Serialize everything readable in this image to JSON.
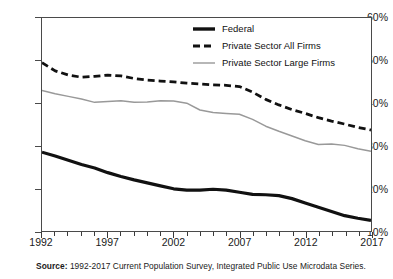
{
  "chart_data": {
    "type": "line",
    "title": "",
    "xlabel": "",
    "ylabel": "",
    "xlim": [
      1992,
      2017
    ],
    "ylim": [
      10,
      60
    ],
    "y_tick_labels": [
      "60%",
      "50%",
      "40%",
      "30%",
      "20%",
      "10%"
    ],
    "y_tick_values": [
      60,
      50,
      40,
      30,
      20,
      10
    ],
    "x_tick_labels": [
      "1992",
      "1997",
      "2002",
      "2007",
      "2012",
      "2017"
    ],
    "x_tick_values": [
      1992,
      1997,
      2002,
      2007,
      2012,
      2017
    ],
    "x_minor_ticks_every": 1,
    "grid": false,
    "legend_position": "top-right",
    "x": [
      1992,
      1993,
      1994,
      1995,
      1996,
      1997,
      1998,
      1999,
      2000,
      2001,
      2002,
      2003,
      2004,
      2005,
      2006,
      2007,
      2008,
      2009,
      2010,
      2011,
      2012,
      2013,
      2014,
      2015,
      2016,
      2017
    ],
    "series": [
      {
        "name": "Federal",
        "style": "solid",
        "color": "#111111",
        "width": 3.2,
        "values": [
          28.5,
          27.6,
          26.6,
          25.6,
          24.8,
          23.7,
          22.8,
          22.0,
          21.3,
          20.6,
          19.9,
          19.6,
          19.6,
          19.8,
          19.6,
          19.1,
          18.6,
          18.5,
          18.3,
          17.6,
          16.6,
          15.6,
          14.6,
          13.6,
          13.0,
          12.5
        ]
      },
      {
        "name": "Private Sector All Firms",
        "style": "dashed",
        "color": "#111111",
        "width": 2.8,
        "values": [
          49.5,
          47.6,
          46.6,
          46.1,
          46.3,
          46.6,
          46.4,
          45.8,
          45.4,
          45.2,
          45.0,
          44.7,
          44.5,
          44.3,
          44.2,
          43.9,
          42.6,
          40.9,
          39.6,
          38.5,
          37.6,
          36.6,
          35.8,
          35.1,
          34.3,
          33.7
        ]
      },
      {
        "name": "Private Sector Large Firms",
        "style": "solid",
        "color": "#999999",
        "width": 1.5,
        "values": [
          43.0,
          42.2,
          41.6,
          41.0,
          40.2,
          40.4,
          40.6,
          40.2,
          40.3,
          40.6,
          40.5,
          40.0,
          38.4,
          37.8,
          37.6,
          37.4,
          36.2,
          34.6,
          33.4,
          32.3,
          31.2,
          30.3,
          30.4,
          30.1,
          29.3,
          28.7
        ]
      }
    ]
  },
  "legend": {
    "items": [
      {
        "label": "Federal",
        "style": "solid-thick",
        "color": "#111111"
      },
      {
        "label": "Private Sector All Firms",
        "style": "dashed-thick",
        "color": "#111111"
      },
      {
        "label": "Private Sector Large Firms",
        "style": "solid-thin",
        "color": "#999999"
      }
    ]
  },
  "caption": {
    "label": "Source:",
    "text": " 1992-2017 Current Population Survey, Integrated Public Use Microdata Series."
  }
}
